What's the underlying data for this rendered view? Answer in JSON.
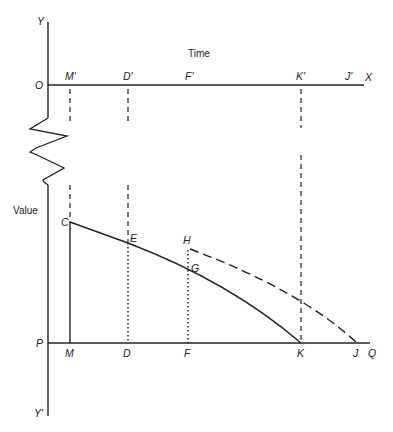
{
  "diagram": {
    "axis_title_x": "Time",
    "axis_title_y": "Value",
    "labels": {
      "Y": "Y",
      "Yprime": "Y'",
      "O": "O",
      "X": "X",
      "P": "P",
      "Q": "Q",
      "Mprime": "M'",
      "Dprime": "D'",
      "Fprime": "F'",
      "Kprime": "K'",
      "Jprime": "J'",
      "M": "M",
      "D": "D",
      "F": "F",
      "K": "K",
      "J": "J",
      "C": "C",
      "E": "E",
      "H": "H",
      "G": "G"
    },
    "colors": {
      "ink": "#222222",
      "background": "#ffffff"
    }
  }
}
